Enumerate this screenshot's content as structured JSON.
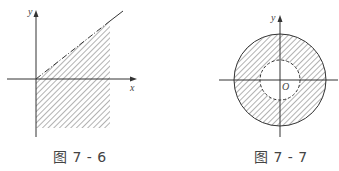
{
  "figures": [
    {
      "id": "fig-7-6",
      "caption": "图 7 - 6",
      "x_label": "x",
      "y_label": "y",
      "description": "Shaded region to the right of the y-axis, below the line y = kx (dash-dotted boundary), extending below the x-axis",
      "line_color": "#333333",
      "hatch_color": "#555555"
    },
    {
      "id": "fig-7-7",
      "caption": "图 7 - 7",
      "x_label": "",
      "y_label": "y",
      "origin_label": "O",
      "description": "Annulus: shaded ring between solid outer circle and dashed inner circle centered at origin O",
      "line_color": "#333333",
      "hatch_color": "#555555"
    }
  ]
}
